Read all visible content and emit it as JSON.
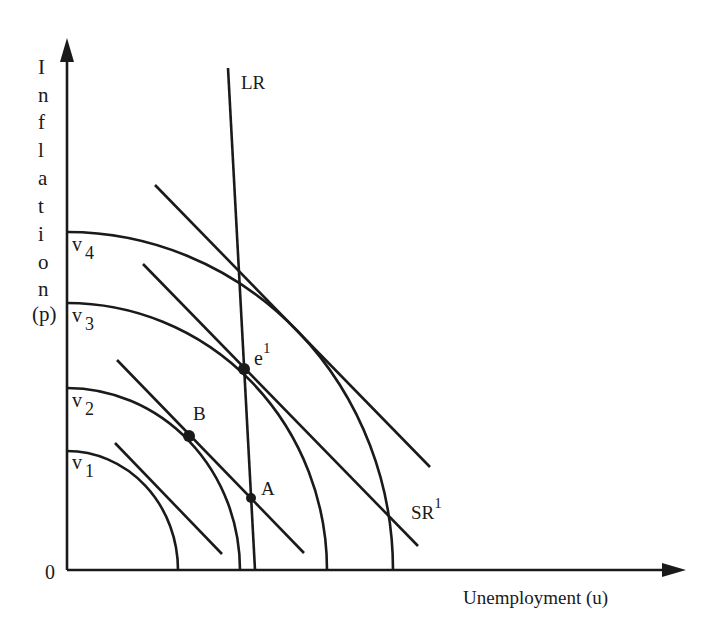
{
  "diagram": {
    "type": "economics-phillips-curve-indifference",
    "y_axis_label_letters": [
      "I",
      "n",
      "f",
      "l",
      "a",
      "t",
      "i",
      "o",
      "n"
    ],
    "y_axis_label_suffix": "(p)",
    "x_axis_label": "Unemployment (u)",
    "origin_label": "0",
    "long_run_label": "LR",
    "short_run_label": "SR",
    "short_run_superscript": "1",
    "indifference_curves": [
      {
        "name": "v",
        "sub": "1"
      },
      {
        "name": "v",
        "sub": "2"
      },
      {
        "name": "v",
        "sub": "3"
      },
      {
        "name": "v",
        "sub": "4"
      }
    ],
    "points": {
      "e": {
        "label": "e",
        "sup": "1"
      },
      "B": {
        "label": "B"
      },
      "A": {
        "label": "A"
      }
    },
    "colors": {
      "ink": "#1a1a1a",
      "background": "#ffffff"
    }
  }
}
